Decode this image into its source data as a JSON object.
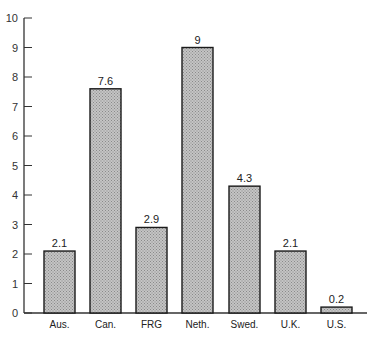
{
  "chart_data": {
    "type": "bar",
    "title": "",
    "xlabel": "",
    "ylabel": "",
    "categories": [
      "Aus.",
      "Can.",
      "FRG",
      "Neth.",
      "Swed.",
      "U.K.",
      "U.S."
    ],
    "values": [
      2.1,
      7.6,
      2.9,
      9,
      4.3,
      2.1,
      0.2
    ],
    "value_labels": [
      "2.1",
      "7.6",
      "2.9",
      "9",
      "4.3",
      "2.1",
      "0.2"
    ],
    "ylim": [
      0,
      10
    ],
    "yticks": [
      0,
      1,
      2,
      3,
      4,
      5,
      6,
      7,
      8,
      9,
      10
    ],
    "grid": false,
    "legend": null,
    "bar_style": "stippled gray fill with black outline"
  },
  "colors": {
    "bar_fill": "#b8b8b8",
    "bar_stroke": "#1a1a1a",
    "axis": "#333333"
  }
}
